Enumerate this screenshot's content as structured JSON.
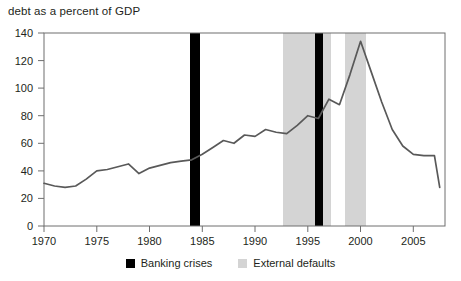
{
  "chart_data": {
    "type": "line",
    "title": "debt as a percent of GDP",
    "xlabel": "",
    "ylabel": "",
    "xlim": [
      1970,
      2008
    ],
    "ylim": [
      0,
      140
    ],
    "yticks": [
      0,
      20,
      40,
      60,
      80,
      100,
      120,
      140
    ],
    "xticks": [
      1970,
      1975,
      1980,
      1985,
      1990,
      1995,
      2000,
      2005
    ],
    "grid": false,
    "legend_position": "bottom-center",
    "series": [
      {
        "name": "debt as a percent of GDP",
        "color": "#595959",
        "x": [
          1970,
          1971,
          1972,
          1973,
          1974,
          1975,
          1976,
          1977,
          1978,
          1979,
          1980,
          1981,
          1982,
          1983,
          1984,
          1985,
          1986,
          1987,
          1988,
          1989,
          1990,
          1991,
          1992,
          1993,
          1994,
          1995,
          1996,
          1997,
          1998,
          1999,
          2000,
          2001,
          2002,
          2003,
          2004,
          2005,
          2006,
          2007,
          2007.5
        ],
        "values": [
          31,
          29,
          28,
          29,
          34,
          40,
          41,
          43,
          45,
          38,
          42,
          44,
          46,
          47,
          48,
          52,
          57,
          62,
          60,
          66,
          65,
          70,
          68,
          67,
          73,
          80,
          78,
          92,
          88,
          110,
          134,
          112,
          90,
          70,
          58,
          52,
          51,
          51,
          28
        ]
      }
    ],
    "shaded_bands": [
      {
        "label": "External defaults",
        "color": "#d4d4d4",
        "spans": [
          [
            1994.0,
            1998.6
          ],
          [
            1999.1,
            2001.2
          ]
        ]
      },
      {
        "label": "Banking crises",
        "color": "#000000",
        "spans": [
          [
            1984.5,
            1985.5
          ],
          [
            1997.3,
            1998.1
          ]
        ]
      }
    ]
  },
  "legend": {
    "items": [
      {
        "label": "Banking crises",
        "color": "#000000"
      },
      {
        "label": "External defaults",
        "color": "#d4d4d4"
      }
    ]
  },
  "axis": {
    "y_tick_labels": [
      "140",
      "120",
      "100",
      "80",
      "60",
      "40",
      "20",
      "0"
    ],
    "x_tick_labels": [
      "1970",
      "1975",
      "1980",
      "1985",
      "1990",
      "1995",
      "2000",
      "2005"
    ]
  }
}
